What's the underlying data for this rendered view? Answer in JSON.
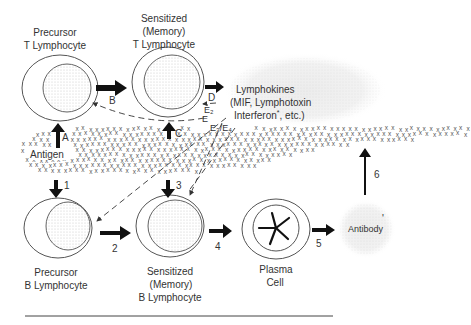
{
  "cells": {
    "precursor_t": {
      "line1": "Precursor",
      "line2": "T Lymphocyte"
    },
    "sensitized_t": {
      "line1": "Sensitized",
      "line2": "(Memory)",
      "line3": "T Lymphocyte"
    },
    "precursor_b": {
      "line1": "Precursor",
      "line2": "B Lymphocyte"
    },
    "sensitized_b": {
      "line1": "Sensitized",
      "line2": "(Memory)",
      "line3": "B Lymphocyte"
    },
    "plasma": {
      "line1": "Plasma",
      "line2": "Cell"
    }
  },
  "lymphokines": {
    "line1": "Lymphokines",
    "line2": "(MIF, Lymphotoxin",
    "line3": "Interferon",
    "asterisk": "*",
    "line3_tail": ", etc.)"
  },
  "antibody": {
    "label": "Antibody",
    "mark": "'"
  },
  "antigen": {
    "label": "Antigen",
    "glyph": "x"
  },
  "arrows": {
    "A": "A",
    "B": "B",
    "C": "C",
    "D": "D",
    "E1": "E",
    "E2": "E₂",
    "E34": "E₃/E₄",
    "n1": "1",
    "n2": "2",
    "n3": "3",
    "n4": "4",
    "n5": "5",
    "n6": "6"
  },
  "colors": {
    "ink": "#111111",
    "cell_outline": "#555555",
    "nucleus_fill": "#e6e6e6",
    "stipple": "#d9d9d9"
  }
}
